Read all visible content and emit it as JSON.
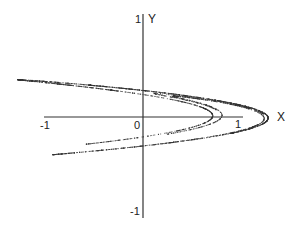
{
  "chart_data": {
    "type": "scatter",
    "title": "",
    "subtitle": "",
    "xlabel": "X",
    "ylabel": "Y",
    "xlim": [
      -1,
      1
    ],
    "ylim": [
      -1,
      1
    ],
    "grid": false,
    "legend": null,
    "x_tick_labels": [
      "-1",
      "0",
      "1"
    ],
    "y_tick_labels": [
      "1",
      "-1"
    ],
    "series": [
      {
        "name": "Hénon attractor",
        "generator": {
          "a": 1.4,
          "b": 0.3,
          "x0": 0.1,
          "y0": 0.1,
          "transient": 100,
          "points": 3000
        },
        "approx_extent": {
          "x": [
            -1.28,
            1.27
          ],
          "y": [
            -0.39,
            0.39
          ]
        },
        "key_points": [
          {
            "x": -1.28,
            "y": 0.39,
            "note": "upper-left tip"
          },
          {
            "x": -0.93,
            "y": -0.38,
            "note": "lower-left tip"
          },
          {
            "x": 1.27,
            "y": 0.0,
            "note": "outer fold vertex"
          },
          {
            "x": 0.7,
            "y": 0.0,
            "note": "inner fold vertex"
          }
        ]
      }
    ]
  },
  "labels": {
    "x_neg1": "-1",
    "x_zero": "0",
    "x_pos1": "1",
    "x_axis_name": "X",
    "y_pos1": "1",
    "y_neg1": "-1",
    "y_axis_name": "Y"
  },
  "colors": {
    "axis": "#333333",
    "points": "#333333",
    "background": "#ffffff"
  },
  "layout": {
    "origin_px": [
      143,
      117
    ],
    "scale_px_per_unit": 98,
    "x_axis_px": [
      44,
      243
    ],
    "y_axis_px": [
      14,
      218
    ]
  }
}
